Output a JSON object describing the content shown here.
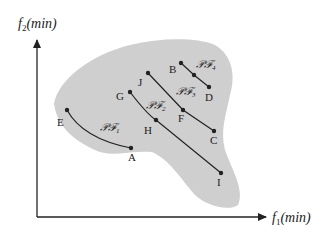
{
  "axes": {
    "y_label_main": "f",
    "y_label_sub": "2",
    "y_label_rest": "(min)",
    "x_label_main": "f",
    "x_label_sub": "1",
    "x_label_rest": "(min)"
  },
  "fronts": [
    {
      "name": "PF1",
      "label_main": "𝒫ℱ",
      "label_sub": "1",
      "points": [
        "E",
        "A"
      ]
    },
    {
      "name": "PF2",
      "label_main": "𝒫ℱ",
      "label_sub": "2",
      "points": [
        "G",
        "H",
        "I"
      ]
    },
    {
      "name": "PF3",
      "label_main": "𝒫ℱ",
      "label_sub": "3",
      "points": [
        "J",
        "F",
        "C"
      ]
    },
    {
      "name": "PF4",
      "label_main": "𝒫ℱ",
      "label_sub": "4",
      "points": [
        "B",
        "D"
      ]
    }
  ],
  "point_labels": {
    "A": "A",
    "B": "B",
    "C": "C",
    "D": "D",
    "E": "E",
    "F": "F",
    "G": "G",
    "H": "H",
    "I": "I",
    "J": "J"
  },
  "colors": {
    "region": "#cfcfcf",
    "line": "#222222"
  }
}
